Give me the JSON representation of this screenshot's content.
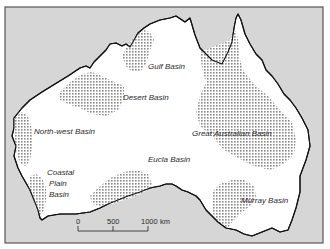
{
  "map": {
    "title": "Sedimentary basins of Australia",
    "colors": {
      "sea": "#d6d6d6",
      "land": "#ffffff",
      "coastline": "#111111",
      "basin_hatch": "#8a8a8a",
      "frame": "#555555"
    },
    "basins": [
      {
        "id": "gulf",
        "label": "Gulf Basin"
      },
      {
        "id": "desert",
        "label": "Desert Basin"
      },
      {
        "id": "north-west",
        "label": "North-west Basin"
      },
      {
        "id": "great-australian",
        "label": "Great Australian Basin"
      },
      {
        "id": "eucla",
        "label": "Eucla Basin"
      },
      {
        "id": "coastal-plain",
        "label_lines": [
          "Coastal",
          "Plain",
          "Basin"
        ]
      },
      {
        "id": "murray",
        "label": "Murray Basin"
      }
    ],
    "scale_bar": {
      "ticks": [
        "0",
        "500",
        "1000"
      ],
      "unit": "km"
    }
  }
}
